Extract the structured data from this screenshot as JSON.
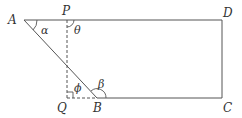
{
  "diagram": {
    "type": "geometry",
    "line_color": "#555555",
    "text_color": "#333333",
    "points": {
      "A": {
        "label": "A",
        "x": 24,
        "y": 20
      },
      "P": {
        "label": "P",
        "x": 67,
        "y": 20
      },
      "D": {
        "label": "D",
        "x": 222,
        "y": 20
      },
      "Q": {
        "label": "Q",
        "x": 67,
        "y": 98
      },
      "B": {
        "label": "B",
        "x": 97,
        "y": 98
      },
      "C": {
        "label": "C",
        "x": 222,
        "y": 98
      }
    },
    "angles": {
      "alpha": {
        "label": "α"
      },
      "theta": {
        "label": "θ"
      },
      "phi": {
        "label": "ϕ"
      },
      "beta": {
        "label": "β"
      }
    },
    "segments": [
      {
        "from": "A",
        "to": "D",
        "style": "solid"
      },
      {
        "from": "D",
        "to": "C",
        "style": "solid"
      },
      {
        "from": "B",
        "to": "C",
        "style": "solid"
      },
      {
        "from": "A",
        "to": "B",
        "style": "solid"
      },
      {
        "from": "P",
        "to": "Q",
        "style": "dashed"
      },
      {
        "from": "Q",
        "to": "B",
        "style": "dashed"
      }
    ],
    "right_angle_at": "Q"
  }
}
